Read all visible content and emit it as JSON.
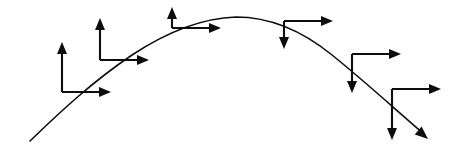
{
  "figure": {
    "background_color": "#ffffff",
    "stroke_color": "#0d0d0d",
    "width": 464,
    "height": 154
  },
  "chart_data": {
    "type": "line",
    "subtitle": "",
    "xlabel": "",
    "ylabel": "",
    "xlim": [
      0,
      464
    ],
    "ylim": [
      154,
      0
    ],
    "grid": false,
    "legend": "none",
    "annotations": [],
    "tick_labels": {
      "x": [],
      "y": []
    },
    "series": [
      {
        "name": "trajectory",
        "kind": "parabolic-arc",
        "description": "Parabolic projectile path rising from lower-left, peaking near mid-right, descending to lower-right with an arrowhead at the end",
        "start_point": [
          30,
          141
        ],
        "peak_point": [
          236,
          17
        ],
        "end_point": [
          428,
          138
        ],
        "path_d": "M 30 141 C 60 112, 92 82, 132 55 C 170 30, 205 18, 236 17 C 268 17, 300 29, 332 55 C 362 79, 396 110, 424 134",
        "end_arrow": {
          "tip": [
            428,
            139
          ],
          "angle_deg": 41,
          "size": 13
        }
      }
    ],
    "vectors": [
      {
        "id": "point-1",
        "origin": [
          62,
          92
        ],
        "components": [
          {
            "name": "horizontal-velocity",
            "direction": "right",
            "tip": [
              111,
              92
            ],
            "length": 49
          },
          {
            "name": "vertical-velocity",
            "direction": "up",
            "tip": [
              62,
              42
            ],
            "length": 50
          }
        ]
      },
      {
        "id": "point-2",
        "origin": [
          100,
          60
        ],
        "components": [
          {
            "name": "horizontal-velocity",
            "direction": "right",
            "tip": [
              149,
              60
            ],
            "length": 49
          },
          {
            "name": "vertical-velocity",
            "direction": "up",
            "tip": [
              100,
              18
            ],
            "length": 42
          }
        ]
      },
      {
        "id": "point-3",
        "origin": [
          172,
          28
        ],
        "components": [
          {
            "name": "horizontal-velocity",
            "direction": "right",
            "tip": [
              221,
              28
            ],
            "length": 49
          },
          {
            "name": "vertical-velocity",
            "direction": "up",
            "tip": [
              172,
              7
            ],
            "length": 21
          }
        ]
      },
      {
        "id": "point-4",
        "origin": [
          284,
          21
        ],
        "components": [
          {
            "name": "horizontal-velocity",
            "direction": "right",
            "tip": [
              333,
              21
            ],
            "length": 49
          },
          {
            "name": "vertical-velocity",
            "direction": "down",
            "tip": [
              284,
              49
            ],
            "length": 28
          }
        ]
      },
      {
        "id": "point-5",
        "origin": [
          352,
          54
        ],
        "components": [
          {
            "name": "horizontal-velocity",
            "direction": "right",
            "tip": [
              401,
              54
            ],
            "length": 49
          },
          {
            "name": "vertical-velocity",
            "direction": "down",
            "tip": [
              352,
              93
            ],
            "length": 39
          }
        ]
      },
      {
        "id": "point-6",
        "origin": [
          392,
          89
        ],
        "components": [
          {
            "name": "horizontal-velocity",
            "direction": "right",
            "tip": [
              441,
              89
            ],
            "length": 49
          },
          {
            "name": "vertical-velocity",
            "direction": "down",
            "tip": [
              392,
              140
            ],
            "length": 51
          }
        ]
      }
    ]
  }
}
